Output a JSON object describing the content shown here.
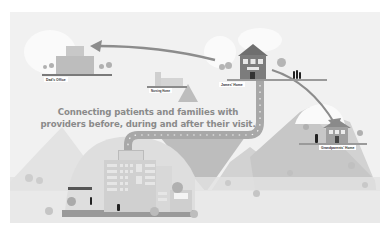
{
  "illustration": {
    "tagline_line1": "Connecting patients and families with",
    "tagline_line2": "providers before, during and after their visit.",
    "locations": {
      "dads_office": "Dad's Office",
      "nursing_home": "Nursing Home",
      "james_home": "James' Home",
      "grandparents_home": "Grandparents' Home",
      "hospital_sign": "Hospital Information Center"
    },
    "colors": {
      "background": "#f1f1f1",
      "mountain_light": "#e2e2e2",
      "mountain_mid": "#cfcfcf",
      "mountain_dark": "#b8b8b8",
      "road": "#a8a8a8",
      "arrow": "#8c8c8c",
      "building": "#9a9a9a",
      "text": "#8a8a8a"
    }
  }
}
